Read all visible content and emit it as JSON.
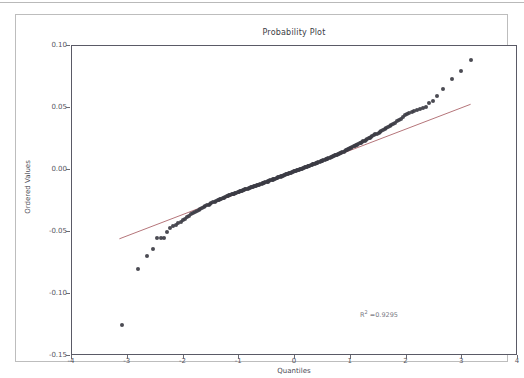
{
  "figure": {
    "title": "Probability Plot",
    "xlabel": "Quantiles",
    "ylabel": "Ordered Values",
    "annotation_r2_prefix": "R",
    "annotation_r2_sup": "2",
    "annotation_r2_value": " =0.9295"
  },
  "colors": {
    "marker": "#3c3c44",
    "fitline": "#b5757a",
    "axis": "#5a5a66",
    "tick_text": "#55555f",
    "figure_border": "#bdbdbd"
  },
  "chart_data": {
    "type": "scatter",
    "title": "Probability Plot",
    "xlabel": "Quantiles",
    "ylabel": "Ordered Values",
    "xlim": [
      -4,
      4
    ],
    "ylim": [
      -0.15,
      0.1
    ],
    "xticks": [
      -4,
      -3,
      -2,
      -1,
      0,
      1,
      2,
      3,
      4
    ],
    "yticks": [
      0.1,
      0.05,
      0.0,
      -0.05,
      -0.1,
      -0.15
    ],
    "ytick_labels": [
      "0.10",
      "0.05",
      "0.00",
      "-0.05",
      "-0.10",
      "-0.15"
    ],
    "xtick_labels": [
      "-4",
      "-3",
      "-2",
      "-1",
      "0",
      "1",
      "2",
      "3",
      "4"
    ],
    "grid": false,
    "legend": null,
    "annotations": [
      {
        "text": "R2 =0.9295",
        "x": 1.18,
        "y": -0.1165
      }
    ],
    "series": [
      {
        "name": "ordered values",
        "type": "scatter",
        "marker": "circle",
        "color": "#3c3c44",
        "points": [
          [
            -3.1,
            -0.125
          ],
          [
            -2.82,
            -0.08
          ],
          [
            -2.66,
            -0.069
          ],
          [
            -2.55,
            -0.064
          ],
          [
            -2.47,
            -0.0552
          ],
          [
            -2.41,
            -0.0548
          ],
          [
            -2.35,
            -0.0545
          ],
          [
            -2.29,
            -0.05
          ],
          [
            -2.24,
            -0.047
          ],
          [
            -2.19,
            -0.0452
          ],
          [
            -2.14,
            -0.044
          ],
          [
            -2.1,
            -0.043
          ],
          [
            -2.05,
            -0.0418
          ],
          [
            -2.01,
            -0.0405
          ],
          [
            -1.97,
            -0.0392
          ],
          [
            -1.93,
            -0.0378
          ],
          [
            -1.9,
            -0.0368
          ],
          [
            -1.86,
            -0.0358
          ],
          [
            -1.83,
            -0.0348
          ],
          [
            -1.79,
            -0.0338
          ],
          [
            -1.76,
            -0.033
          ],
          [
            -1.73,
            -0.0322
          ],
          [
            -1.7,
            -0.0314
          ],
          [
            -1.67,
            -0.0306
          ],
          [
            -1.64,
            -0.0299
          ],
          [
            -1.61,
            -0.0292
          ],
          [
            -1.58,
            -0.0285
          ],
          [
            -1.55,
            -0.0279
          ],
          [
            -1.52,
            -0.0273
          ],
          [
            -1.5,
            -0.0267
          ],
          [
            -1.47,
            -0.0261
          ],
          [
            -1.44,
            -0.0256
          ],
          [
            -1.42,
            -0.025
          ],
          [
            -1.39,
            -0.0245
          ],
          [
            -1.37,
            -0.024
          ],
          [
            -1.34,
            -0.0235
          ],
          [
            -1.32,
            -0.0231
          ],
          [
            -1.29,
            -0.0226
          ],
          [
            -1.27,
            -0.0222
          ],
          [
            -1.25,
            -0.0218
          ],
          [
            -1.22,
            -0.0213
          ],
          [
            -1.2,
            -0.0209
          ],
          [
            -1.18,
            -0.0205
          ],
          [
            -1.16,
            -0.0201
          ],
          [
            -1.13,
            -0.0197
          ],
          [
            -1.11,
            -0.0194
          ],
          [
            -1.09,
            -0.019
          ],
          [
            -1.07,
            -0.0186
          ],
          [
            -1.05,
            -0.0183
          ],
          [
            -1.03,
            -0.0179
          ],
          [
            -1.01,
            -0.0176
          ],
          [
            -0.99,
            -0.0172
          ],
          [
            -0.97,
            -0.0169
          ],
          [
            -0.95,
            -0.0166
          ],
          [
            -0.93,
            -0.0162
          ],
          [
            -0.91,
            -0.0159
          ],
          [
            -0.89,
            -0.0156
          ],
          [
            -0.87,
            -0.0153
          ],
          [
            -0.85,
            -0.015
          ],
          [
            -0.83,
            -0.0147
          ],
          [
            -0.81,
            -0.0144
          ],
          [
            -0.79,
            -0.0141
          ],
          [
            -0.77,
            -0.0138
          ],
          [
            -0.75,
            -0.0135
          ],
          [
            -0.73,
            -0.0132
          ],
          [
            -0.71,
            -0.0129
          ],
          [
            -0.7,
            -0.0126
          ],
          [
            -0.68,
            -0.0123
          ],
          [
            -0.66,
            -0.012
          ],
          [
            -0.64,
            -0.0117
          ],
          [
            -0.62,
            -0.0114
          ],
          [
            -0.6,
            -0.0111
          ],
          [
            -0.58,
            -0.0108
          ],
          [
            -0.57,
            -0.0105
          ],
          [
            -0.55,
            -0.0102
          ],
          [
            -0.53,
            -0.0099
          ],
          [
            -0.51,
            -0.0096
          ],
          [
            -0.49,
            -0.0093
          ],
          [
            -0.48,
            -0.009
          ],
          [
            -0.46,
            -0.0087
          ],
          [
            -0.44,
            -0.0084
          ],
          [
            -0.42,
            -0.0081
          ],
          [
            -0.4,
            -0.0078
          ],
          [
            -0.39,
            -0.0075
          ],
          [
            -0.37,
            -0.0072
          ],
          [
            -0.35,
            -0.0069
          ],
          [
            -0.33,
            -0.0066
          ],
          [
            -0.32,
            -0.0063
          ],
          [
            -0.3,
            -0.006
          ],
          [
            -0.28,
            -0.0057
          ],
          [
            -0.26,
            -0.0054
          ],
          [
            -0.25,
            -0.0051
          ],
          [
            -0.23,
            -0.0048
          ],
          [
            -0.21,
            -0.0045
          ],
          [
            -0.19,
            -0.0042
          ],
          [
            -0.18,
            -0.0039
          ],
          [
            -0.16,
            -0.0036
          ],
          [
            -0.14,
            -0.0033
          ],
          [
            -0.12,
            -0.003
          ],
          [
            -0.11,
            -0.0027
          ],
          [
            -0.09,
            -0.0024
          ],
          [
            -0.07,
            -0.0021
          ],
          [
            -0.05,
            -0.0018
          ],
          [
            -0.04,
            -0.0015
          ],
          [
            -0.02,
            -0.0012
          ],
          [
            0.0,
            -0.0009
          ],
          [
            0.02,
            -0.0006
          ],
          [
            0.04,
            -0.0003
          ],
          [
            0.05,
            0.0
          ],
          [
            0.07,
            0.0003
          ],
          [
            0.09,
            0.0006
          ],
          [
            0.11,
            0.0009
          ],
          [
            0.12,
            0.0012
          ],
          [
            0.14,
            0.0015
          ],
          [
            0.16,
            0.0018
          ],
          [
            0.18,
            0.0021
          ],
          [
            0.19,
            0.0024
          ],
          [
            0.21,
            0.0027
          ],
          [
            0.23,
            0.003
          ],
          [
            0.25,
            0.0033
          ],
          [
            0.26,
            0.0036
          ],
          [
            0.28,
            0.0039
          ],
          [
            0.3,
            0.0042
          ],
          [
            0.32,
            0.0045
          ],
          [
            0.33,
            0.0048
          ],
          [
            0.35,
            0.0051
          ],
          [
            0.37,
            0.0054
          ],
          [
            0.39,
            0.0057
          ],
          [
            0.4,
            0.006
          ],
          [
            0.42,
            0.0063
          ],
          [
            0.44,
            0.0066
          ],
          [
            0.46,
            0.0069
          ],
          [
            0.48,
            0.0072
          ],
          [
            0.49,
            0.0075
          ],
          [
            0.51,
            0.0079
          ],
          [
            0.53,
            0.0082
          ],
          [
            0.55,
            0.0085
          ],
          [
            0.57,
            0.0089
          ],
          [
            0.58,
            0.0092
          ],
          [
            0.6,
            0.0096
          ],
          [
            0.62,
            0.0099
          ],
          [
            0.64,
            0.0103
          ],
          [
            0.66,
            0.0106
          ],
          [
            0.68,
            0.011
          ],
          [
            0.7,
            0.0114
          ],
          [
            0.71,
            0.0117
          ],
          [
            0.73,
            0.0121
          ],
          [
            0.75,
            0.0125
          ],
          [
            0.77,
            0.0129
          ],
          [
            0.79,
            0.0133
          ],
          [
            0.81,
            0.0137
          ],
          [
            0.83,
            0.0141
          ],
          [
            0.85,
            0.0145
          ],
          [
            0.87,
            0.0149
          ],
          [
            0.89,
            0.0153
          ],
          [
            0.91,
            0.0158
          ],
          [
            0.93,
            0.0162
          ],
          [
            0.95,
            0.0167
          ],
          [
            0.97,
            0.0171
          ],
          [
            0.99,
            0.0176
          ],
          [
            1.01,
            0.018
          ],
          [
            1.03,
            0.0185
          ],
          [
            1.05,
            0.019
          ],
          [
            1.07,
            0.0195
          ],
          [
            1.09,
            0.02
          ],
          [
            1.11,
            0.0205
          ],
          [
            1.13,
            0.021
          ],
          [
            1.16,
            0.0215
          ],
          [
            1.18,
            0.0221
          ],
          [
            1.2,
            0.0226
          ],
          [
            1.22,
            0.0232
          ],
          [
            1.25,
            0.0237
          ],
          [
            1.27,
            0.0243
          ],
          [
            1.29,
            0.0249
          ],
          [
            1.32,
            0.0255
          ],
          [
            1.34,
            0.0261
          ],
          [
            1.37,
            0.0267
          ],
          [
            1.39,
            0.0274
          ],
          [
            1.42,
            0.028
          ],
          [
            1.44,
            0.0287
          ],
          [
            1.47,
            0.0294
          ],
          [
            1.5,
            0.0301
          ],
          [
            1.52,
            0.0308
          ],
          [
            1.55,
            0.0315
          ],
          [
            1.58,
            0.0323
          ],
          [
            1.61,
            0.0331
          ],
          [
            1.64,
            0.0339
          ],
          [
            1.67,
            0.0347
          ],
          [
            1.7,
            0.0356
          ],
          [
            1.73,
            0.0365
          ],
          [
            1.76,
            0.0374
          ],
          [
            1.79,
            0.0383
          ],
          [
            1.83,
            0.0393
          ],
          [
            1.86,
            0.0404
          ],
          [
            1.9,
            0.0415
          ],
          [
            1.93,
            0.0427
          ],
          [
            1.97,
            0.044
          ],
          [
            2.01,
            0.0453
          ],
          [
            2.05,
            0.0462
          ],
          [
            2.1,
            0.047
          ],
          [
            2.14,
            0.0478
          ],
          [
            2.19,
            0.0484
          ],
          [
            2.24,
            0.049
          ],
          [
            2.29,
            0.0496
          ],
          [
            2.35,
            0.051
          ],
          [
            2.41,
            0.0538
          ],
          [
            2.47,
            0.056
          ],
          [
            2.55,
            0.06
          ],
          [
            2.66,
            0.065
          ],
          [
            2.82,
            0.073
          ],
          [
            2.98,
            0.08
          ],
          [
            3.15,
            0.089
          ]
        ]
      },
      {
        "name": "fit line",
        "type": "line",
        "color": "#b5757a",
        "endpoints": [
          [
            -3.15,
            -0.0555
          ],
          [
            3.15,
            0.053
          ]
        ]
      }
    ]
  }
}
